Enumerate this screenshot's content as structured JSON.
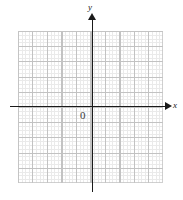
{
  "figure": {
    "type": "coordinate-grid",
    "title": "",
    "background_color": "#ffffff",
    "width": 183,
    "height": 200
  },
  "axes": {
    "x_axis": {
      "label": "x",
      "color": "#1a1a1a",
      "arrow": "right-arrowhead"
    },
    "y_axis": {
      "label": "y",
      "color": "#1a1a1a",
      "arrow": "up-arrowhead"
    },
    "origin": {
      "label": "0",
      "color": "#3a3a3a"
    }
  },
  "grid": {
    "major_columns": 10,
    "major_rows": 10,
    "minor_per_major": 4,
    "major_color": "#b5b5b5",
    "minor_color": "#d9d9d9",
    "border_color": "#c4c4c4",
    "tick_labels": [],
    "legend": []
  },
  "chart_data": {
    "type": "scatter",
    "title": "",
    "subtitle": "",
    "xlabel": "x",
    "ylabel": "y",
    "origin_label": "0",
    "xlim": [
      -5,
      5
    ],
    "ylim": [
      -5,
      5
    ],
    "xticks": [
      -5,
      -4,
      -3,
      -2,
      -1,
      0,
      1,
      2,
      3,
      4,
      5
    ],
    "yticks": [
      -5,
      -4,
      -3,
      -2,
      -1,
      0,
      1,
      2,
      3,
      4,
      5
    ],
    "xtick_labels": [],
    "ytick_labels": [],
    "grid": true,
    "minor_grid": true,
    "legend": [],
    "legend_position": "none",
    "annotations": [],
    "series": [
      {
        "name": "",
        "x": [],
        "y": []
      }
    ]
  }
}
